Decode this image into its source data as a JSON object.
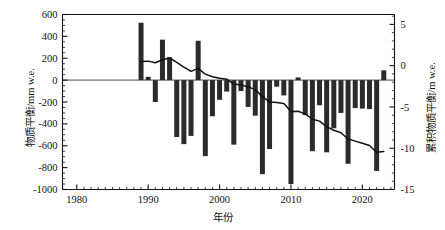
{
  "chart_data": {
    "type": "bar",
    "title": "",
    "xlabel": "年份",
    "ylabel": "物质平衡/mm w.e.",
    "ylabel_right": "累积物质平衡/m w.e.",
    "xlim": [
      1978,
      2024.5
    ],
    "ylim": [
      -1000,
      600
    ],
    "ylim_right": [
      -15,
      6.2
    ],
    "grid": false,
    "legend": false,
    "xticks": [
      1980,
      1990,
      2000,
      2010,
      2020
    ],
    "xtick_labels": [
      "1980",
      "1990",
      "2000",
      "2010",
      "2020"
    ],
    "yticks": [
      600,
      400,
      200,
      0,
      -200,
      -400,
      -600,
      -800,
      -1000
    ],
    "ytick_labels": [
      "600",
      "400",
      "200",
      "0",
      "-200",
      "-400",
      "-600",
      "-800",
      "-1000"
    ],
    "yticks_right": [
      5,
      0,
      -5,
      -10,
      -15
    ],
    "ytick_labels_right": [
      "5",
      "0",
      "-5",
      "-10",
      "-15"
    ],
    "minor_tick_interval_x": 1,
    "minor_tick_interval_y": 50,
    "bar_color": "#2b2b2b",
    "line_color": "#111111",
    "zero_line_color": "#999999",
    "series": [
      {
        "name": "物质平衡",
        "type": "bar",
        "axis": "left",
        "units": "mm w.e.",
        "x": [
          1989,
          1990,
          1991,
          1992,
          1993,
          1994,
          1995,
          1996,
          1997,
          1998,
          1999,
          2000,
          2001,
          2002,
          2003,
          2004,
          2005,
          2006,
          2007,
          2008,
          2009,
          2010,
          2011,
          2012,
          2013,
          2014,
          2015,
          2016,
          2017,
          2018,
          2019,
          2020,
          2021,
          2022,
          2023
        ],
        "values": [
          525,
          30,
          -200,
          370,
          210,
          -520,
          -585,
          -510,
          360,
          -695,
          -330,
          -180,
          -105,
          -590,
          -100,
          -245,
          -325,
          -860,
          -630,
          -60,
          -140,
          -950,
          25,
          -320,
          -650,
          -230,
          -660,
          -440,
          -300,
          -765,
          -255,
          -260,
          -265,
          -830,
          90
        ]
      },
      {
        "name": "累积物质平衡",
        "type": "line",
        "axis": "right",
        "units": "m w.e.",
        "x": [
          1989,
          1990,
          1991,
          1992,
          1993,
          1994,
          1995,
          1996,
          1997,
          1998,
          1999,
          2000,
          2001,
          2002,
          2003,
          2004,
          2005,
          2006,
          2007,
          2008,
          2009,
          2010,
          2011,
          2012,
          2013,
          2014,
          2015,
          2016,
          2017,
          2018,
          2019,
          2020,
          2021,
          2022,
          2023
        ],
        "values": [
          0.5,
          0.55,
          0.35,
          0.72,
          0.93,
          0.41,
          -0.18,
          -0.69,
          -0.33,
          -1.02,
          -1.35,
          -1.53,
          -1.64,
          -2.23,
          -2.33,
          -2.57,
          -2.9,
          -3.76,
          -4.39,
          -4.45,
          -4.59,
          -5.54,
          -5.52,
          -5.84,
          -6.49,
          -6.72,
          -7.38,
          -7.82,
          -8.12,
          -8.88,
          -9.14,
          -9.4,
          -9.66,
          -10.49,
          -10.4
        ]
      }
    ]
  },
  "labels": {
    "y_left_title": "物质平衡/mm w.e.",
    "y_right_title": "累积物质平衡/m w.e.",
    "x_title": "年份"
  }
}
